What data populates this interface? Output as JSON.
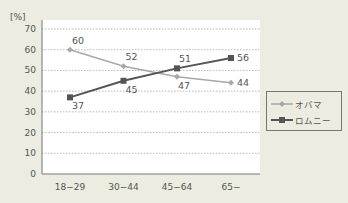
{
  "chart_data": {
    "type": "line",
    "title": "",
    "xlabel": "",
    "ylabel": "[%]",
    "ylim": [
      0,
      70
    ],
    "yticks": [
      0,
      10,
      20,
      30,
      40,
      50,
      60,
      70
    ],
    "categories": [
      "18−29",
      "30−44",
      "45−64",
      "65−"
    ],
    "series": [
      {
        "name": "オバマ",
        "values": [
          60,
          52,
          47,
          44
        ],
        "color": "#a8a8a8",
        "marker": "diamond"
      },
      {
        "name": "ロムニー",
        "values": [
          37,
          45,
          51,
          56
        ],
        "color": "#555555",
        "marker": "square"
      }
    ],
    "grid": true,
    "legend_position": "right"
  },
  "legend": {
    "items": [
      {
        "label": "オバマ"
      },
      {
        "label": "ロムニー"
      }
    ]
  },
  "axis": {
    "unit_label": "[%]"
  }
}
